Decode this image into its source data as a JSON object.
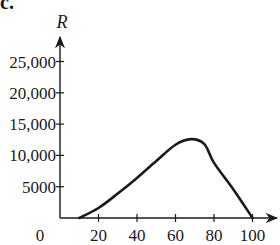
{
  "panel": {
    "label": "c."
  },
  "chart_data": {
    "type": "line",
    "title": "",
    "xlabel": "",
    "ylabel": "R",
    "xlim": [
      0,
      105
    ],
    "ylim": [
      0,
      27000
    ],
    "grid": false,
    "legend": null,
    "x_ticks": [
      20,
      40,
      60,
      80,
      100
    ],
    "x_tick_labels": [
      "20",
      "40",
      "60",
      "80",
      "100"
    ],
    "origin_label": "0",
    "y_ticks": [
      5000,
      10000,
      15000,
      20000,
      25000
    ],
    "y_tick_labels": [
      "5000",
      "10,000",
      "15,000",
      "20,000",
      "25,000"
    ],
    "series": [
      {
        "name": "R",
        "x": [
          10,
          20,
          30,
          40,
          50,
          60,
          68,
          75,
          80,
          90,
          100
        ],
        "values": [
          0,
          1600,
          3900,
          6400,
          9100,
          11700,
          12600,
          11800,
          8800,
          4600,
          0
        ]
      }
    ],
    "colors": {
      "line": "#1a1a1a",
      "axis": "#1a1a1a"
    }
  }
}
